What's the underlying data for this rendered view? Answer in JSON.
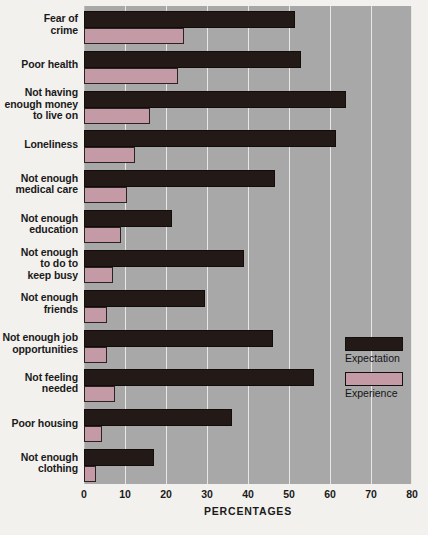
{
  "chart_data": {
    "type": "bar",
    "orientation": "horizontal",
    "title": "",
    "xlabel": "PERCENTAGES",
    "ylabel": "",
    "xlim": [
      0,
      80
    ],
    "xticks": [
      0,
      10,
      20,
      30,
      40,
      50,
      60,
      70,
      80
    ],
    "grid": true,
    "legend_position": "right-middle",
    "categories": [
      "Fear of\ncrime",
      "Poor health",
      "Not having\nenough money\nto live on",
      "Loneliness",
      "Not enough\nmedical care",
      "Not enough\neducation",
      "Not enough\nto do to\nkeep busy",
      "Not enough\nfriends",
      "Not enough job\nopportunities",
      "Not feeling\nneeded",
      "Poor housing",
      "Not enough\nclothing"
    ],
    "series": [
      {
        "name": "Expectation",
        "color": "#231a17",
        "values": [
          51.5,
          53,
          64,
          61.5,
          46.5,
          21.5,
          39,
          29.5,
          46,
          56,
          36,
          17
        ]
      },
      {
        "name": "Experience",
        "color": "#c49aa6",
        "values": [
          24.5,
          23,
          16,
          12.5,
          10.5,
          9,
          7,
          5.5,
          5.5,
          7.5,
          4.5,
          3
        ]
      }
    ]
  },
  "axis": {
    "x_title": "PERCENTAGES",
    "tick_labels": [
      "0",
      "10",
      "20",
      "30",
      "40",
      "50",
      "60",
      "70",
      "80"
    ]
  },
  "ylabels": [
    {
      "lines": [
        "Fear of",
        "crime"
      ]
    },
    {
      "lines": [
        "Poor health"
      ]
    },
    {
      "lines": [
        "Not having",
        "enough money",
        "to live on"
      ]
    },
    {
      "lines": [
        "Loneliness"
      ]
    },
    {
      "lines": [
        "Not enough",
        "medical care"
      ]
    },
    {
      "lines": [
        "Not enough",
        "education"
      ]
    },
    {
      "lines": [
        "Not enough",
        "to do to",
        "keep busy"
      ]
    },
    {
      "lines": [
        "Not enough",
        "friends"
      ]
    },
    {
      "lines": [
        "Not enough job",
        "opportunities"
      ]
    },
    {
      "lines": [
        "Not feeling",
        "needed"
      ]
    },
    {
      "lines": [
        "Poor housing"
      ]
    },
    {
      "lines": [
        "Not enough",
        "clothing"
      ]
    }
  ],
  "legend": {
    "items": [
      {
        "label": "Expectation",
        "color": "#231a17"
      },
      {
        "label": "Experience",
        "color": "#c49aa6"
      }
    ]
  },
  "colors": {
    "plot_background": "#a8a8a8",
    "page_background": "#f3f1ed",
    "gridline": "#e9e7e3",
    "expectation": "#231a17",
    "experience": "#c49aa6",
    "text": "#1a1a1a"
  }
}
